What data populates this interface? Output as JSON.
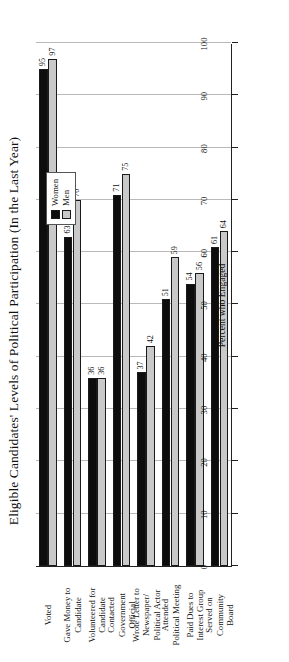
{
  "chart_data": {
    "type": "bar",
    "orientation": "horizontal",
    "title": "Eligible Candidates' Levels of Political Participation (In the Last Year)",
    "xlabel": "Percent who Engaged",
    "ylabel": "",
    "xlim": [
      0,
      100
    ],
    "xticks": [
      0,
      10,
      20,
      30,
      40,
      50,
      60,
      70,
      80,
      90,
      100
    ],
    "xticklabels": [
      "0",
      "10",
      "20",
      "30",
      "40",
      "50",
      "60",
      "70",
      "80",
      "90",
      "100"
    ],
    "grid": true,
    "legend_position": "upper-right",
    "categories": [
      "Voted",
      "Gave Money to Candidate",
      "Volunteered for Candidate",
      "Contacted Government Official",
      "Wrote Letter to Newspaper/ Political Actor",
      "Attended Political Meeting",
      "Paid Dues to Interest Group",
      "Served on Community Board"
    ],
    "category_lines": [
      [
        "Voted"
      ],
      [
        "Gave Money to",
        "Candidate"
      ],
      [
        "Volunteered for",
        "Candidate"
      ],
      [
        "Contacted",
        "Government",
        "Official"
      ],
      [
        "Wrote Letter to",
        "Newspaper/",
        "Political Actor"
      ],
      [
        "Attended",
        "Political Meeting"
      ],
      [
        "Paid Dues to",
        "Interest Group"
      ],
      [
        "Served on",
        "Community",
        "Board"
      ]
    ],
    "series": [
      {
        "name": "Women",
        "color": "#0d0d0d",
        "values": [
          95,
          63,
          36,
          71,
          37,
          51,
          54,
          61
        ]
      },
      {
        "name": "Men",
        "color": "#c9c9c9",
        "values": [
          97,
          70,
          36,
          75,
          42,
          59,
          56,
          64
        ]
      }
    ]
  },
  "legend": {
    "entries": [
      {
        "label": "Women",
        "swatch": "women-swatch-icon"
      },
      {
        "label": "Men",
        "swatch": "men-swatch-icon"
      }
    ]
  }
}
